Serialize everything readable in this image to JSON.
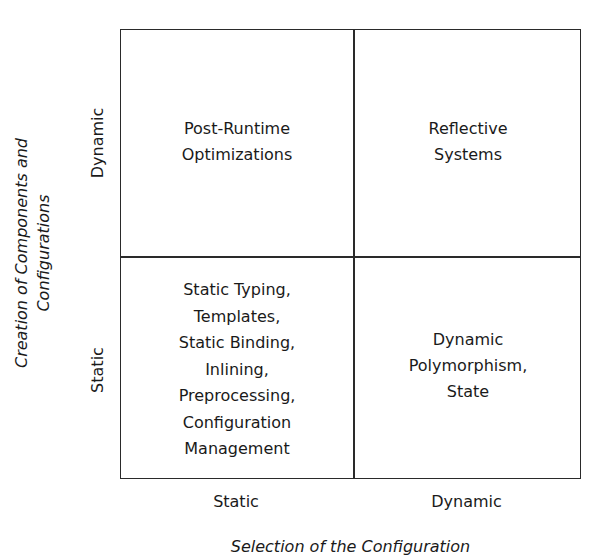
{
  "diagram": {
    "type": "2x2 matrix",
    "x_axis": {
      "title": "Selection of the Configuration",
      "ticks": [
        "Static",
        "Dynamic"
      ]
    },
    "y_axis": {
      "title": "Creation of Components and\nConfigurations",
      "ticks": [
        "Static",
        "Dynamic"
      ]
    },
    "cells": {
      "dynamic_static": "Post-Runtime\nOptimizations",
      "dynamic_dynamic": "Reflective\nSystems",
      "static_static": "Static Typing,\nTemplates,\nStatic Binding,\nInlining,\nPreprocessing,\nConfiguration\nManagement",
      "static_dynamic": "Dynamic\nPolymorphism,\nState"
    },
    "colors": {
      "line": "#2a2a2a",
      "text": "#1a1a1a",
      "background": "#ffffff"
    }
  }
}
